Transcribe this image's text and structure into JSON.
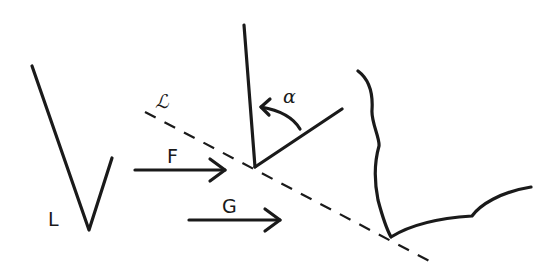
{
  "diagram": {
    "labels": {
      "L": "L",
      "script_L": "ℒ",
      "F": "F",
      "G": "G",
      "alpha": "α"
    },
    "elements": [
      {
        "name": "v-shape",
        "label": "L",
        "description": "V-shaped figure"
      },
      {
        "name": "dashed-line",
        "label": "ℒ",
        "description": "dashed diagonal line"
      },
      {
        "name": "arrow-F",
        "label": "F",
        "direction": "right"
      },
      {
        "name": "arrow-G",
        "label": "G",
        "direction": "right"
      },
      {
        "name": "angle-rays",
        "label": "α",
        "description": "two rays from a point on ℒ with curved arrow indicating angle α"
      },
      {
        "name": "wavy-boundary",
        "description": "irregular curve meeting ℒ"
      }
    ],
    "colors": {
      "ink": "#1a1a1a",
      "background": "#ffffff"
    }
  }
}
